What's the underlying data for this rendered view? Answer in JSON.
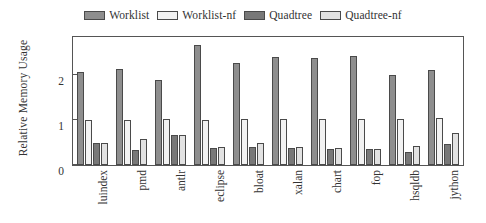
{
  "figure": {
    "background": "#ffffff",
    "frame_color": "#555555",
    "text_color": "#333333"
  },
  "legend": {
    "position": "top-center",
    "entries": [
      {
        "label": "Worklist",
        "color": "#8e8e8e",
        "swatch": "legend-swatch-worklist"
      },
      {
        "label": "Worklist-nf",
        "color": "#f2f2f2",
        "swatch": "legend-swatch-worklist-nf"
      },
      {
        "label": "Quadtree",
        "color": "#787878",
        "swatch": "legend-swatch-quadtree"
      },
      {
        "label": "Quadtree-nf",
        "color": "#e2e2e2",
        "swatch": "legend-swatch-quadtree-nf"
      }
    ]
  },
  "axes": {
    "ylabel": "Relative Memory Usage",
    "xlabel": "",
    "yticks": [
      "0",
      "1",
      "2"
    ],
    "ytick_values": [
      0,
      1,
      2
    ],
    "ylim": [
      0,
      2.85
    ],
    "grid": false
  },
  "chart_data": {
    "type": "bar",
    "title": "",
    "xlabel": "",
    "ylabel": "Relative Memory Usage",
    "ylim": [
      0,
      2.85
    ],
    "yticks": [
      0,
      1,
      2
    ],
    "grid": false,
    "legend_position": "top-center",
    "categories": [
      "luindex",
      "pmd",
      "antlr",
      "eclipse",
      "bloat",
      "xalan",
      "chart",
      "fop",
      "hsqldb",
      "jython"
    ],
    "series": [
      {
        "name": "Worklist",
        "color": "#8e8e8e",
        "values": [
          2.08,
          2.14,
          1.89,
          2.67,
          2.28,
          2.41,
          2.39,
          2.43,
          2.01,
          2.12
        ]
      },
      {
        "name": "Worklist-nf",
        "color": "#f2f2f2",
        "values": [
          1.01,
          1.01,
          1.02,
          1.01,
          1.02,
          1.03,
          1.03,
          1.03,
          1.03,
          1.04
        ]
      },
      {
        "name": "Quadtree",
        "color": "#787878",
        "values": [
          0.5,
          0.34,
          0.66,
          0.37,
          0.41,
          0.37,
          0.36,
          0.35,
          0.28,
          0.47
        ]
      },
      {
        "name": "Quadtree-nf",
        "color": "#e2e2e2",
        "values": [
          0.5,
          0.57,
          0.67,
          0.39,
          0.49,
          0.39,
          0.38,
          0.36,
          0.42,
          0.71
        ]
      }
    ]
  }
}
